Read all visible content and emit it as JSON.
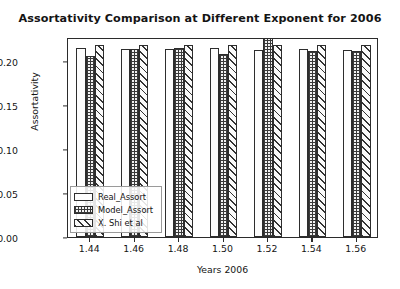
{
  "chart_data": {
    "type": "bar",
    "title": "Assortativity Comparison at Different Exponent for 2006",
    "xlabel": "Years 2006",
    "ylabel": "Assortativity",
    "categories": [
      "1.44",
      "1.46",
      "1.48",
      "1.50",
      "1.52",
      "1.54",
      "1.56"
    ],
    "series": [
      {
        "name": "Real_Assort",
        "values": [
          0.214,
          0.213,
          0.213,
          0.214,
          0.212,
          0.213,
          0.212
        ]
      },
      {
        "name": "Model_Assort",
        "values": [
          0.206,
          0.213,
          0.215,
          0.208,
          0.229,
          0.211,
          0.211
        ]
      },
      {
        "name": "X. Shi et al",
        "values": [
          0.218,
          0.218,
          0.218,
          0.218,
          0.218,
          0.218,
          0.218
        ]
      }
    ],
    "ylim": [
      0.0,
      0.227
    ],
    "yticks": [
      "0.00",
      "0.05",
      "0.10",
      "0.15",
      "0.20"
    ],
    "ytick_values": [
      0.0,
      0.05,
      0.1,
      0.15,
      0.2
    ],
    "grid": false,
    "legend_position": "lower-left-inside"
  },
  "legend": {
    "items": [
      {
        "label": "Real_Assort"
      },
      {
        "label": "Model_Assort"
      },
      {
        "label": "X. Shi et al"
      }
    ]
  }
}
